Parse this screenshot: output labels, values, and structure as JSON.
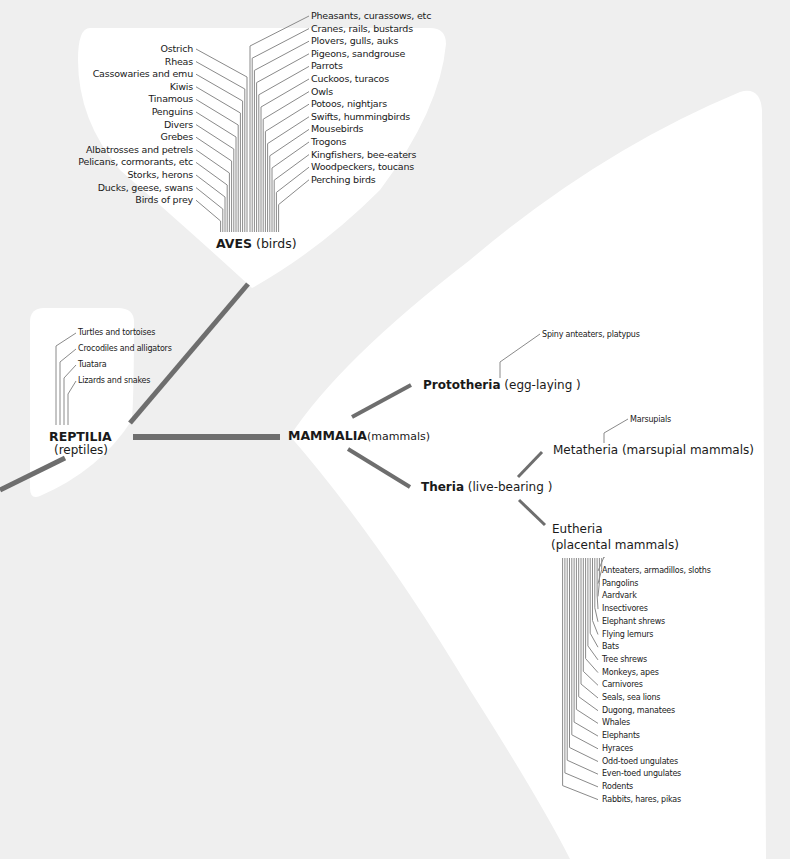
{
  "colors": {
    "background": "#efefef",
    "blob": "#ffffff",
    "branch": "#6e6e6e",
    "thin_line": "#8a8a8a",
    "text": "#1a1a1a"
  },
  "aves": {
    "name": "AVES",
    "common": "(birds)",
    "left": [
      "Ostrich",
      "Rheas",
      "Cassowaries and emu",
      "Kiwis",
      "Tinamous",
      "Penguins",
      "Divers",
      "Grebes",
      "Albatrosses and petrels",
      "Pelicans, cormorants, etc",
      "Storks, herons",
      "Ducks, geese, swans",
      "Birds of prey"
    ],
    "right": [
      "Pheasants, curassows, etc",
      "Cranes, rails, bustards",
      "Plovers, gulls, auks",
      "Pigeons, sandgrouse",
      "Parrots",
      "Cuckoos, turacos",
      "Owls",
      "Potoos, nightjars",
      "Swifts, hummingbirds",
      "Mousebirds",
      "Trogons",
      "Kingfishers, bee-eaters",
      "Woodpeckers, toucans",
      "Perching birds"
    ]
  },
  "reptilia": {
    "name": "REPTILIA",
    "common": "(reptiles)",
    "members": [
      "Turtles and tortoises",
      "Crocodiles and alligators",
      "Tuatara",
      "Lizards and snakes"
    ]
  },
  "mammalia": {
    "name": "MAMMALIA",
    "common": "(mammals)"
  },
  "prototheria": {
    "name": "Prototheria",
    "common": "(egg-laying )",
    "members": [
      "Spiny anteaters, platypus"
    ]
  },
  "theria": {
    "name": "Theria",
    "common": "(live-bearing )"
  },
  "metatheria": {
    "label": "Metatheria (marsupial mammals)",
    "members": [
      "Marsupials"
    ]
  },
  "eutheria": {
    "line1": "Eutheria",
    "line2": "(placental mammals)",
    "members": [
      "Anteaters, armadillos, sloths",
      "Pangolins",
      "Aardvark",
      "Insectivores",
      "Elephant shrews",
      "Flying lemurs",
      "Bats",
      "Tree shrews",
      "Monkeys, apes",
      "Carnivores",
      "Seals, sea lions",
      "Dugong, manatees",
      "Whales",
      "Elephants",
      "Hyraces",
      "Odd-toed ungulates",
      "Even-toed ungulates",
      "Rodents",
      "Rabbits, hares, pikas"
    ]
  }
}
